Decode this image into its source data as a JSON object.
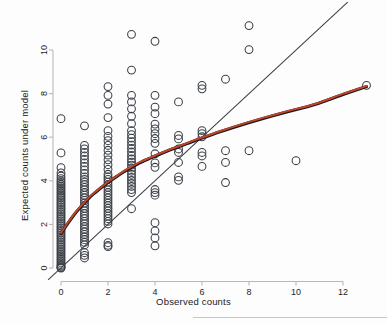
{
  "figure": {
    "background_color": "#fdfdfd",
    "axis_color": "#b9b9b9",
    "marker_stroke_color": "#3a3f46",
    "reference_line_color": "#3c3f45",
    "smoother_dark_color": "#15161c",
    "smoother_red_color": "#c0452a"
  },
  "chart_data": {
    "type": "scatter",
    "title": "",
    "xlabel": "Observed counts",
    "ylabel": "Expected counts under model",
    "xlim": [
      -0.7,
      13.6
    ],
    "ylim": [
      -0.55,
      11.6
    ],
    "xticks": [
      0,
      2,
      4,
      6,
      8,
      10,
      12
    ],
    "xticklabels": [
      "0",
      "2",
      "4",
      "6",
      "8",
      "10",
      "12"
    ],
    "yticks": [
      0,
      2,
      4,
      6,
      8,
      10
    ],
    "yticklabels": [
      "0",
      "2",
      "4",
      "6",
      "8",
      "10"
    ],
    "grid": false,
    "legend": "none",
    "marker": "open-circle",
    "marker_size_px": 5.0,
    "points": [
      [
        0,
        6.85
      ],
      [
        0,
        5.28
      ],
      [
        0,
        4.6
      ],
      [
        0,
        4.36
      ],
      [
        0,
        4.22
      ],
      [
        0,
        4.1
      ],
      [
        0,
        4.0
      ],
      [
        0,
        3.92
      ],
      [
        0,
        3.84
      ],
      [
        0,
        3.76
      ],
      [
        0,
        3.68
      ],
      [
        0,
        3.6
      ],
      [
        0,
        3.52
      ],
      [
        0,
        3.44
      ],
      [
        0,
        3.36
      ],
      [
        0,
        3.28
      ],
      [
        0,
        3.2
      ],
      [
        0,
        3.12
      ],
      [
        0,
        3.04
      ],
      [
        0,
        2.96
      ],
      [
        0,
        2.88
      ],
      [
        0,
        2.8
      ],
      [
        0,
        2.72
      ],
      [
        0,
        2.64
      ],
      [
        0,
        2.56
      ],
      [
        0,
        2.48
      ],
      [
        0,
        2.4
      ],
      [
        0,
        2.32
      ],
      [
        0,
        2.24
      ],
      [
        0,
        2.16
      ],
      [
        0,
        2.08
      ],
      [
        0,
        2.0
      ],
      [
        0,
        1.92
      ],
      [
        0,
        1.84
      ],
      [
        0,
        1.76
      ],
      [
        0,
        1.68
      ],
      [
        0,
        1.6
      ],
      [
        0,
        1.52
      ],
      [
        0,
        1.44
      ],
      [
        0,
        1.36
      ],
      [
        0,
        1.28
      ],
      [
        0,
        1.2
      ],
      [
        0,
        1.12
      ],
      [
        0,
        1.04
      ],
      [
        0,
        0.96
      ],
      [
        0,
        0.88
      ],
      [
        0,
        0.8
      ],
      [
        0,
        0.72
      ],
      [
        0,
        0.64
      ],
      [
        0,
        0.56
      ],
      [
        0,
        0.48
      ],
      [
        0,
        0.4
      ],
      [
        0,
        0.32
      ],
      [
        0,
        0.24
      ],
      [
        0,
        0.16
      ],
      [
        0,
        0.1
      ],
      [
        0,
        0.05
      ],
      [
        0,
        0.02
      ],
      [
        0,
        0.0
      ],
      [
        1,
        6.52
      ],
      [
        1,
        5.62
      ],
      [
        1,
        5.46
      ],
      [
        1,
        5.3
      ],
      [
        1,
        5.14
      ],
      [
        1,
        4.98
      ],
      [
        1,
        4.82
      ],
      [
        1,
        4.66
      ],
      [
        1,
        4.5
      ],
      [
        1,
        4.34
      ],
      [
        1,
        4.18
      ],
      [
        1,
        4.06
      ],
      [
        1,
        3.94
      ],
      [
        1,
        3.82
      ],
      [
        1,
        3.7
      ],
      [
        1,
        3.58
      ],
      [
        1,
        3.46
      ],
      [
        1,
        3.34
      ],
      [
        1,
        3.22
      ],
      [
        1,
        3.1
      ],
      [
        1,
        2.98
      ],
      [
        1,
        2.86
      ],
      [
        1,
        2.74
      ],
      [
        1,
        2.62
      ],
      [
        1,
        2.5
      ],
      [
        1,
        2.38
      ],
      [
        1,
        2.26
      ],
      [
        1,
        2.14
      ],
      [
        1,
        2.02
      ],
      [
        1,
        1.9
      ],
      [
        1,
        1.78
      ],
      [
        1,
        1.66
      ],
      [
        1,
        1.54
      ],
      [
        1,
        1.42
      ],
      [
        1,
        1.3
      ],
      [
        1,
        1.18
      ],
      [
        1,
        1.06
      ],
      [
        1,
        0.7
      ],
      [
        1,
        0.58
      ],
      [
        1,
        0.46
      ],
      [
        2,
        8.32
      ],
      [
        2,
        7.92
      ],
      [
        2,
        7.52
      ],
      [
        2,
        6.9
      ],
      [
        2,
        6.3
      ],
      [
        2,
        6.04
      ],
      [
        2,
        5.84
      ],
      [
        2,
        5.62
      ],
      [
        2,
        5.4
      ],
      [
        2,
        5.18
      ],
      [
        2,
        4.96
      ],
      [
        2,
        4.74
      ],
      [
        2,
        4.52
      ],
      [
        2,
        4.3
      ],
      [
        2,
        4.18
      ],
      [
        2,
        4.06
      ],
      [
        2,
        3.94
      ],
      [
        2,
        3.82
      ],
      [
        2,
        3.7
      ],
      [
        2,
        3.58
      ],
      [
        2,
        3.46
      ],
      [
        2,
        3.34
      ],
      [
        2,
        3.22
      ],
      [
        2,
        3.1
      ],
      [
        2,
        2.98
      ],
      [
        2,
        2.86
      ],
      [
        2,
        2.74
      ],
      [
        2,
        2.62
      ],
      [
        2,
        2.5
      ],
      [
        2,
        2.38
      ],
      [
        2,
        2.26
      ],
      [
        2,
        2.14
      ],
      [
        2,
        2.02
      ],
      [
        2,
        1.16
      ],
      [
        2,
        1.04
      ],
      [
        2,
        0.98
      ],
      [
        3,
        10.72
      ],
      [
        3,
        9.08
      ],
      [
        3,
        7.92
      ],
      [
        3,
        7.62
      ],
      [
        3,
        7.3
      ],
      [
        3,
        6.96
      ],
      [
        3,
        6.62
      ],
      [
        3,
        6.3
      ],
      [
        3,
        6.12
      ],
      [
        3,
        5.96
      ],
      [
        3,
        5.8
      ],
      [
        3,
        5.64
      ],
      [
        3,
        5.48
      ],
      [
        3,
        5.32
      ],
      [
        3,
        5.16
      ],
      [
        3,
        5.0
      ],
      [
        3,
        4.86
      ],
      [
        3,
        4.72
      ],
      [
        3,
        4.58
      ],
      [
        3,
        4.44
      ],
      [
        3,
        4.3
      ],
      [
        3,
        4.16
      ],
      [
        3,
        4.02
      ],
      [
        3,
        3.88
      ],
      [
        3,
        3.74
      ],
      [
        3,
        3.6
      ],
      [
        3,
        3.46
      ],
      [
        3,
        2.72
      ],
      [
        4,
        10.4
      ],
      [
        4,
        7.92
      ],
      [
        4,
        7.38
      ],
      [
        4,
        7.08
      ],
      [
        4,
        6.6
      ],
      [
        4,
        6.38
      ],
      [
        4,
        6.16
      ],
      [
        4,
        5.94
      ],
      [
        4,
        5.72
      ],
      [
        4,
        5.24
      ],
      [
        4,
        4.82
      ],
      [
        4,
        4.62
      ],
      [
        4,
        3.6
      ],
      [
        4,
        3.46
      ],
      [
        4,
        3.34
      ],
      [
        4,
        2.08
      ],
      [
        4,
        1.7
      ],
      [
        4,
        1.38
      ],
      [
        4,
        1.02
      ],
      [
        5,
        7.62
      ],
      [
        5,
        6.08
      ],
      [
        5,
        5.92
      ],
      [
        5,
        5.46
      ],
      [
        5,
        5.3
      ],
      [
        5,
        4.84
      ],
      [
        5,
        4.18
      ],
      [
        5,
        4.02
      ],
      [
        6,
        8.38
      ],
      [
        6,
        8.22
      ],
      [
        6,
        6.3
      ],
      [
        6,
        6.16
      ],
      [
        6,
        6.02
      ],
      [
        6,
        5.3
      ],
      [
        6,
        5.14
      ],
      [
        6,
        4.66
      ],
      [
        7,
        8.66
      ],
      [
        7,
        5.38
      ],
      [
        7,
        4.84
      ],
      [
        7,
        3.92
      ],
      [
        8,
        11.12
      ],
      [
        8,
        10.02
      ],
      [
        8,
        5.38
      ],
      [
        10,
        4.92
      ],
      [
        13,
        8.38
      ]
    ],
    "reference_line": {
      "name": "identity-line",
      "type": "line",
      "description": "y = x diagonal reference line",
      "x": [
        -0.55,
        12.2
      ],
      "y": [
        -0.55,
        12.2
      ],
      "color": "#3c3f45",
      "width_px": 1.05
    },
    "smoother": {
      "name": "loess-smoother",
      "type": "line",
      "description": "concave smoothed fit, dark line overlaid by red line",
      "x": [
        0.0,
        0.3,
        0.6,
        0.9,
        1.2,
        1.5,
        1.8,
        2.1,
        2.4,
        2.7,
        3.0,
        3.4,
        3.8,
        4.2,
        4.6,
        5.0,
        5.5,
        6.0,
        6.8,
        7.6,
        8.6,
        9.6,
        10.8,
        12.0,
        13.0
      ],
      "y": [
        1.58,
        2.06,
        2.5,
        2.88,
        3.22,
        3.5,
        3.76,
        4.0,
        4.22,
        4.43,
        4.62,
        4.85,
        5.04,
        5.22,
        5.4,
        5.56,
        5.76,
        5.96,
        6.26,
        6.54,
        6.86,
        7.16,
        7.5,
        7.96,
        8.32
      ],
      "colors": [
        "#15161c",
        "#c0452a"
      ],
      "width_px": 3.1
    }
  }
}
